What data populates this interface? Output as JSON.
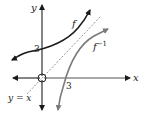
{
  "diagram": {
    "title": "",
    "axes": {
      "x_label": "x",
      "y_label": "y",
      "origin_marker": "circle"
    },
    "curves": [
      {
        "name": "f",
        "label": "f",
        "color": "#1a1a1a",
        "y_intercept": 3
      },
      {
        "name": "f_inverse",
        "label": "f",
        "superscript": "−1",
        "color": "#808080",
        "x_intercept": 3
      }
    ],
    "reference_line": {
      "label": "y = x",
      "style": "dashed",
      "color": "#808080"
    },
    "tick_labels": {
      "y_axis_3": "3",
      "x_axis_3": "3"
    }
  }
}
